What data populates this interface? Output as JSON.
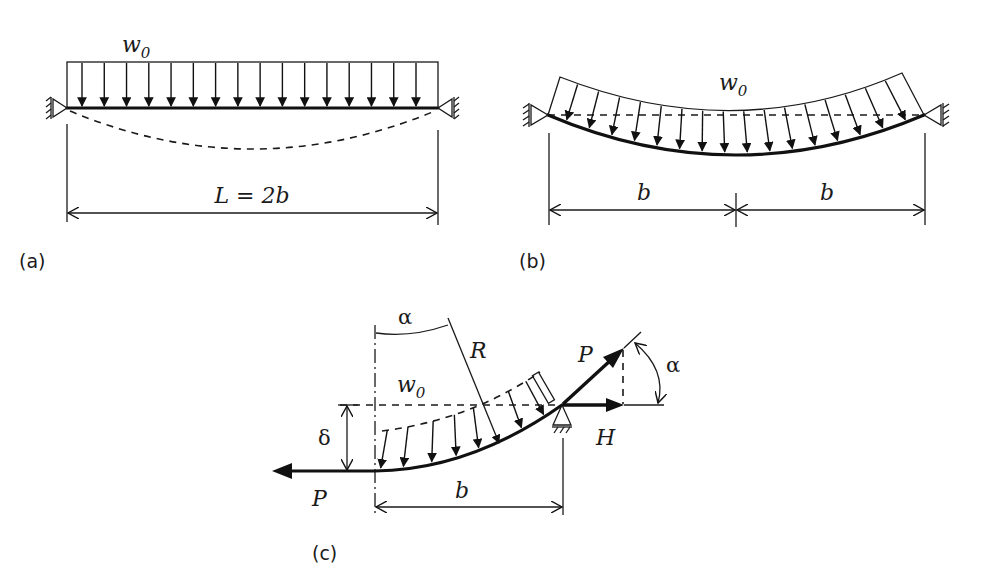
{
  "figure": {
    "panels": [
      {
        "id": "a",
        "label": "(a)",
        "load_label": "w",
        "load_subscript": "0",
        "dimension_label": "L = 2b",
        "load_arrow_count": 16,
        "description": "Straight beam under uniform load w0 between two pinned supports; dashed deflected shape"
      },
      {
        "id": "b",
        "label": "(b)",
        "load_label": "w",
        "load_subscript": "0",
        "dimension_left": "b",
        "dimension_right": "b",
        "load_arrow_count": 16,
        "description": "Deflected beam with load normal to curved beam; dashed chord between supports"
      },
      {
        "id": "c",
        "label": "(c)",
        "load_label": "w",
        "load_subscript": "0",
        "angle_top": "α",
        "radius_label": "R",
        "force_left": "P",
        "force_inclined": "P",
        "force_horizontal": "H",
        "angle_right": "α",
        "deflection_label": "δ",
        "dimension_label": "b",
        "description": "Half-beam free body with end tension P, horizontal component H and inclination angle α"
      }
    ]
  },
  "colors": {
    "ink": "#1a1a1a",
    "background": "#ffffff"
  }
}
